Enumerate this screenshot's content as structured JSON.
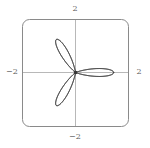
{
  "figure": {
    "title": "",
    "background_color": "#ffffff",
    "frame_color": "#8a8a8a",
    "axis_color": "#b8b8b8",
    "curve_color": "#3a3a3a",
    "label_color": "#5a5a5a"
  },
  "axes": {
    "ticks": {
      "top": "2",
      "bottom": "−2",
      "left": "−2",
      "right": "2"
    }
  },
  "chart_data": {
    "type": "line",
    "plot_style": "polar",
    "title": "",
    "xlabel": "",
    "ylabel": "",
    "xlim": [
      -2,
      2
    ],
    "ylim": [
      -2,
      2
    ],
    "xticks": [
      -2,
      2
    ],
    "yticks": [
      -2,
      2
    ],
    "xticklabels": [
      "−2",
      "2"
    ],
    "yticklabels": [
      "−2",
      "2"
    ],
    "grid": false,
    "legend": null,
    "axis_lines": "crosshair through origin",
    "frame": "rounded rectangle",
    "series": [
      {
        "name": "r(theta)",
        "formula": "r = cos(3*theta) + 0.45*cos(9*theta)",
        "theta_min": 0,
        "theta_max": 6.283185307179586,
        "samples": 1400,
        "r_max": 1.42,
        "petals": 6,
        "inner_petals": 6
      }
    ]
  }
}
